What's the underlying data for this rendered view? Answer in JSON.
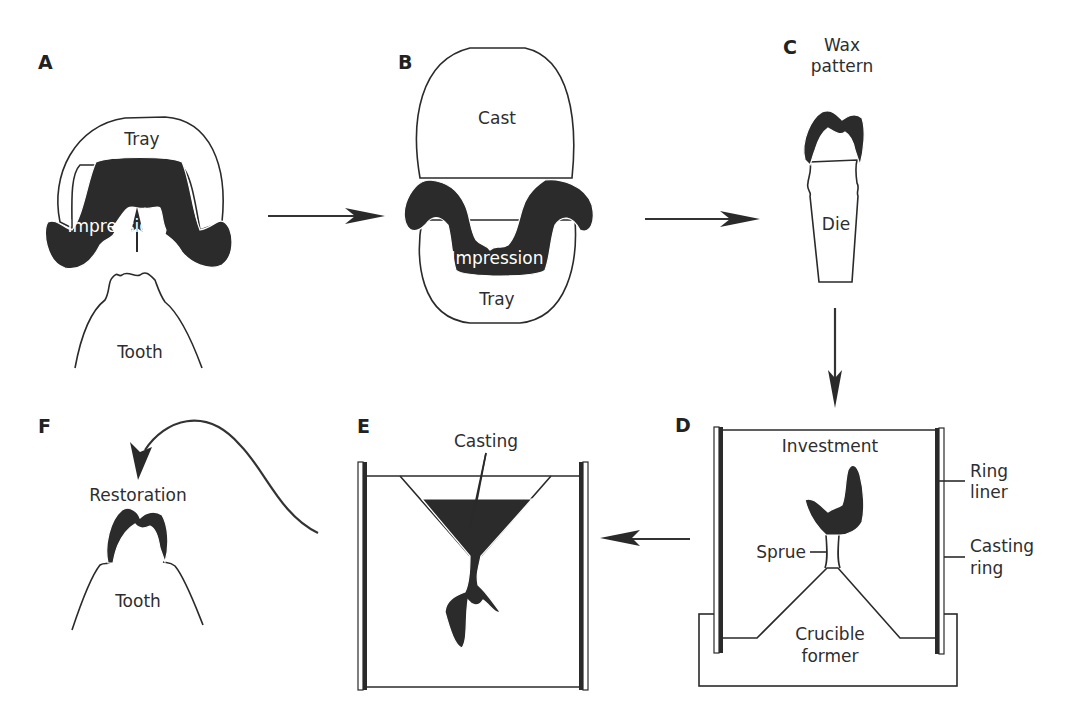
{
  "diagram": {
    "panels": [
      {
        "id": "A",
        "letter": "A",
        "labels": {
          "tray": "Tray",
          "impression": "Impression",
          "tooth": "Tooth"
        }
      },
      {
        "id": "B",
        "letter": "B",
        "labels": {
          "cast": "Cast",
          "impression": "Impression",
          "tray": "Tray"
        }
      },
      {
        "id": "C",
        "letter": "C",
        "labels": {
          "wax_line1": "Wax",
          "wax_line2": "pattern",
          "die": "Die"
        }
      },
      {
        "id": "D",
        "letter": "D",
        "labels": {
          "investment": "Investment",
          "sprue": "Sprue",
          "ring_liner_1": "Ring",
          "ring_liner_2": "liner",
          "casting_ring_1": "Casting",
          "casting_ring_2": "ring",
          "crucible_1": "Crucible",
          "crucible_2": "former"
        }
      },
      {
        "id": "E",
        "letter": "E",
        "labels": {
          "casting": "Casting"
        }
      },
      {
        "id": "F",
        "letter": "F",
        "labels": {
          "restoration": "Restoration",
          "tooth": "Tooth"
        }
      }
    ],
    "flow": [
      "A",
      "B",
      "C",
      "D",
      "E",
      "F"
    ],
    "arrows": [
      {
        "from": "A",
        "to": "B",
        "direction": "right"
      },
      {
        "from": "B",
        "to": "C",
        "direction": "right"
      },
      {
        "from": "C",
        "to": "D",
        "direction": "down"
      },
      {
        "from": "D",
        "to": "E",
        "direction": "left"
      },
      {
        "from": "E",
        "to": "F",
        "direction": "curved-left-down"
      }
    ],
    "colors": {
      "material_dark": "#2b2b2b",
      "outline": "#2a2a2a",
      "background": "#ffffff"
    }
  }
}
